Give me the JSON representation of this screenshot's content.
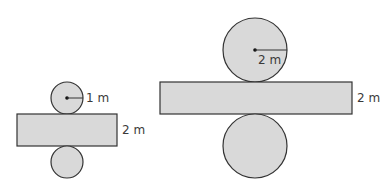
{
  "diagram": {
    "type": "cylinder-nets",
    "fill_color": "#d9d9d9",
    "stroke_color": "#333333",
    "nets": [
      {
        "id": "small-cylinder-net",
        "radius_label": "1 m",
        "height_label": "2 m",
        "top_circle": {
          "cx": 67,
          "cy": 98,
          "r": 16
        },
        "rectangle": {
          "x": 17,
          "y": 114,
          "width": 100,
          "height": 32
        },
        "bottom_circle": {
          "cx": 67,
          "cy": 162,
          "r": 16
        }
      },
      {
        "id": "large-cylinder-net",
        "radius_label": "2 m",
        "height_label": "2 m",
        "top_circle": {
          "cx": 255,
          "cy": 50,
          "r": 32
        },
        "rectangle": {
          "x": 160,
          "y": 82,
          "width": 192,
          "height": 32
        },
        "bottom_circle": {
          "cx": 255,
          "cy": 146,
          "r": 32
        }
      }
    ]
  }
}
